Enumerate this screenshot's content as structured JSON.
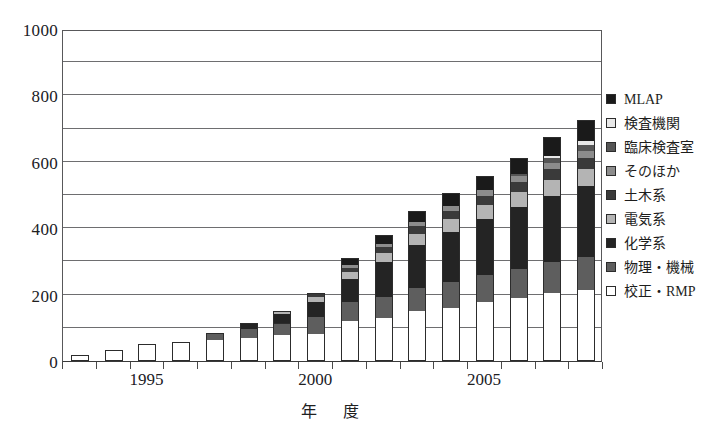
{
  "chart_data": {
    "type": "bar",
    "subtype": "stacked-bar",
    "title": "",
    "xlabel": "年　度",
    "ylabel": "",
    "ylim": [
      0,
      1000
    ],
    "ytick_step": 200,
    "gridline_step": 100,
    "grid": true,
    "legend_position": "right",
    "categories": [
      1993,
      1994,
      1995,
      1996,
      1997,
      1998,
      1999,
      2000,
      2001,
      2002,
      2003,
      2004,
      2005,
      2006,
      2007,
      2008
    ],
    "xtick_labels": [
      "1995",
      "2000",
      "2005"
    ],
    "xtick_categories": [
      1995,
      2000,
      2005
    ],
    "ytick_labels": [
      "0",
      "200",
      "400",
      "600",
      "800",
      "1000"
    ],
    "ytick_values": [
      0,
      200,
      400,
      600,
      800,
      1000
    ],
    "series": [
      {
        "name": "校正・RMP",
        "color": "#ffffff",
        "values": [
          15,
          30,
          48,
          55,
          62,
          70,
          78,
          82,
          120,
          130,
          150,
          160,
          178,
          190,
          205,
          215
        ]
      },
      {
        "name": "物理・機械",
        "color": "#5e5e5e",
        "values": [
          0,
          0,
          0,
          0,
          18,
          25,
          35,
          50,
          58,
          62,
          70,
          78,
          82,
          88,
          92,
          98
        ]
      },
      {
        "name": "化学系",
        "color": "#242424",
        "values": [
          0,
          0,
          0,
          0,
          0,
          18,
          28,
          45,
          68,
          105,
          130,
          150,
          168,
          185,
          200,
          215
        ]
      },
      {
        "name": "電気系",
        "color": "#b4b4b4",
        "values": [
          0,
          0,
          0,
          0,
          0,
          0,
          8,
          16,
          22,
          28,
          34,
          40,
          42,
          45,
          48,
          50
        ]
      },
      {
        "name": "土木系",
        "color": "#3a3a3a",
        "values": [
          0,
          0,
          0,
          0,
          0,
          0,
          0,
          10,
          12,
          18,
          22,
          25,
          28,
          30,
          32,
          34
        ]
      },
      {
        "name": "そのほか",
        "color": "#8c8c8c",
        "values": [
          0,
          0,
          0,
          0,
          0,
          0,
          0,
          0,
          8,
          10,
          12,
          14,
          16,
          18,
          20,
          22
        ]
      },
      {
        "name": "臨床検査室",
        "color": "#555555",
        "values": [
          0,
          0,
          0,
          0,
          0,
          0,
          0,
          0,
          0,
          0,
          0,
          0,
          0,
          8,
          14,
          18
        ]
      },
      {
        "name": "検査機関",
        "color": "#e8e8e8",
        "values": [
          0,
          0,
          0,
          0,
          0,
          0,
          0,
          0,
          0,
          0,
          0,
          0,
          0,
          0,
          6,
          10
        ]
      },
      {
        "name": "MLAP",
        "color": "#1a1a1a",
        "values": [
          0,
          0,
          0,
          0,
          0,
          0,
          0,
          0,
          20,
          25,
          30,
          35,
          40,
          45,
          55,
          60
        ]
      }
    ],
    "totals": [
      15,
      30,
      48,
      55,
      80,
      133,
      167,
      221,
      256,
      313,
      475,
      540,
      595,
      662,
      704,
      800,
      862
    ]
  },
  "legend": {
    "items": [
      {
        "label": "MLAP",
        "color": "#1a1a1a"
      },
      {
        "label": "検査機関",
        "color": "#e8e8e8"
      },
      {
        "label": "臨床検査室",
        "color": "#555555"
      },
      {
        "label": "そのほか",
        "color": "#8c8c8c"
      },
      {
        "label": "土木系",
        "color": "#3a3a3a"
      },
      {
        "label": "電気系",
        "color": "#b4b4b4"
      },
      {
        "label": "化学系",
        "color": "#242424"
      },
      {
        "label": "物理・機械",
        "color": "#5e5e5e"
      },
      {
        "label": "校正・RMP",
        "color": "#ffffff"
      }
    ]
  },
  "axes": {
    "x_title": "年　度"
  }
}
